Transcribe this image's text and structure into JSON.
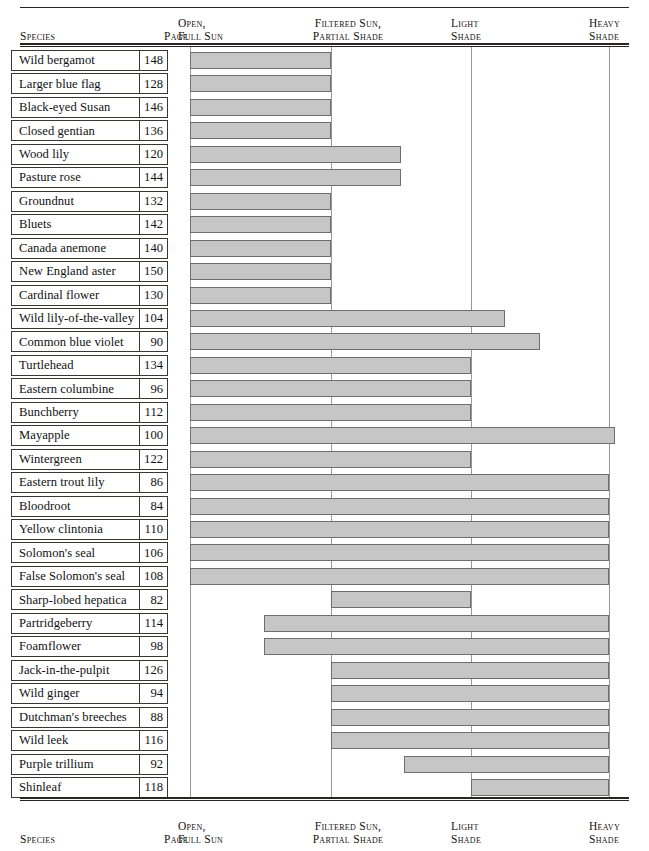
{
  "table": {
    "columns": {
      "species": "Species",
      "page": "Page",
      "open_full_sun": "Open,\nFull Sun",
      "filtered_partial": "Filtered Sun,\nPartial Shade",
      "light_shade": "Light\nShade",
      "heavy_shade": "Heavy\nShade"
    },
    "colors": {
      "bar_fill": "#c6c6c6",
      "bar_border": "#6e6e6e",
      "rule": "#2a2522",
      "gridline": "#9a9893"
    }
  },
  "chart_data": {
    "type": "bar",
    "title": "",
    "xlabel": "",
    "ylabel": "Species",
    "grid": true,
    "legend_position": "none",
    "orientation": "horizontal-range",
    "axis_categories": [
      "Open, Full Sun",
      "Filtered Sun, Partial Shade",
      "Light Shade",
      "Heavy Shade"
    ],
    "axis_tick_px": [
      190,
      331,
      471,
      609
    ],
    "note": "Each bar spans the light-condition range tolerated by the species; start/end given in axis-fraction units where 0 = Open Full Sun line and 3 = Heavy Shade line.",
    "rows": [
      {
        "species": "Wild bergamot",
        "page": "148",
        "start_px": 190,
        "end_px": 331
      },
      {
        "species": "Larger blue flag",
        "page": "128",
        "start_px": 190,
        "end_px": 331
      },
      {
        "species": "Black-eyed Susan",
        "page": "146",
        "start_px": 190,
        "end_px": 331
      },
      {
        "species": "Closed gentian",
        "page": "136",
        "start_px": 190,
        "end_px": 331
      },
      {
        "species": "Wood lily",
        "page": "120",
        "start_px": 190,
        "end_px": 401
      },
      {
        "species": "Pasture rose",
        "page": "144",
        "start_px": 190,
        "end_px": 401
      },
      {
        "species": "Groundnut",
        "page": "132",
        "start_px": 190,
        "end_px": 331
      },
      {
        "species": "Bluets",
        "page": "142",
        "start_px": 190,
        "end_px": 331
      },
      {
        "species": "Canada anemone",
        "page": "140",
        "start_px": 190,
        "end_px": 331
      },
      {
        "species": "New England aster",
        "page": "150",
        "start_px": 190,
        "end_px": 331
      },
      {
        "species": "Cardinal flower",
        "page": "130",
        "start_px": 190,
        "end_px": 331
      },
      {
        "species": "Wild lily-of-the-valley",
        "page": "104",
        "start_px": 190,
        "end_px": 505
      },
      {
        "species": "Common blue violet",
        "page": "90",
        "start_px": 190,
        "end_px": 540
      },
      {
        "species": "Turtlehead",
        "page": "134",
        "start_px": 190,
        "end_px": 471
      },
      {
        "species": "Eastern columbine",
        "page": "96",
        "start_px": 190,
        "end_px": 471
      },
      {
        "species": "Bunchberry",
        "page": "112",
        "start_px": 190,
        "end_px": 471
      },
      {
        "species": "Mayapple",
        "page": "100",
        "start_px": 190,
        "end_px": 615
      },
      {
        "species": "Wintergreen",
        "page": "122",
        "start_px": 190,
        "end_px": 471
      },
      {
        "species": "Eastern trout lily",
        "page": "86",
        "start_px": 190,
        "end_px": 609
      },
      {
        "species": "Bloodroot",
        "page": "84",
        "start_px": 190,
        "end_px": 609
      },
      {
        "species": "Yellow clintonia",
        "page": "110",
        "start_px": 190,
        "end_px": 609
      },
      {
        "species": "Solomon's seal",
        "page": "106",
        "start_px": 190,
        "end_px": 609
      },
      {
        "species": "False Solomon's seal",
        "page": "108",
        "start_px": 190,
        "end_px": 609
      },
      {
        "species": "Sharp-lobed hepatica",
        "page": "82",
        "start_px": 331,
        "end_px": 471
      },
      {
        "species": "Partridgeberry",
        "page": "114",
        "start_px": 264,
        "end_px": 609
      },
      {
        "species": "Foamflower",
        "page": "98",
        "start_px": 264,
        "end_px": 609
      },
      {
        "species": "Jack-in-the-pulpit",
        "page": "126",
        "start_px": 331,
        "end_px": 609
      },
      {
        "species": "Wild ginger",
        "page": "94",
        "start_px": 331,
        "end_px": 609
      },
      {
        "species": "Dutchman's breeches",
        "page": "88",
        "start_px": 331,
        "end_px": 609
      },
      {
        "species": "Wild leek",
        "page": "116",
        "start_px": 331,
        "end_px": 609
      },
      {
        "species": "Purple trillium",
        "page": "92",
        "start_px": 404,
        "end_px": 609
      },
      {
        "species": "Shinleaf",
        "page": "118",
        "start_px": 471,
        "end_px": 609
      }
    ]
  }
}
